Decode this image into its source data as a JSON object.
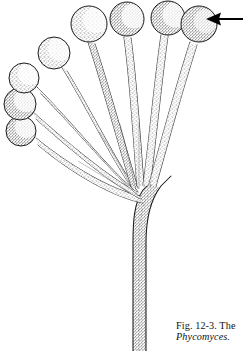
{
  "figure": {
    "kind": "scientific-line-illustration",
    "background_color": "#ffffff",
    "ink_color": "#1a1a1a",
    "stipple_color": "#555555",
    "caption": {
      "line1": "Fig. 12-3.  The",
      "line2": "Phycomyces.",
      "line2_style": "italic"
    },
    "pointer": {
      "name": "arrow-annotation",
      "direction": "left",
      "tip_x": 206,
      "tip_y": 19,
      "tail_x": 243,
      "tail_y": 19,
      "color": "#000000"
    },
    "main_stalk": {
      "name": "main-stipe",
      "description": "single thick stalk rising from bottom edge, bending left near top into branch fan",
      "base_x_left": 133,
      "base_x_right": 146,
      "base_y": 351,
      "bend_y": 215,
      "fan_x": 131,
      "fan_y": 188
    },
    "sporangiophores": [
      {
        "id": 1,
        "label": "sporangiophore-left-lowest",
        "head_cx": 21,
        "head_cy": 131,
        "head_r": 15,
        "stalk_from_x": 131,
        "stalk_from_y": 190,
        "ctrl_x": 80,
        "ctrl_y": 172,
        "shade_side": "left"
      },
      {
        "id": 2,
        "label": "sporangiophore-left-middle",
        "head_cx": 20,
        "head_cy": 104,
        "head_r": 16,
        "stalk_from_x": 132,
        "stalk_from_y": 190,
        "ctrl_x": 82,
        "ctrl_y": 158,
        "shade_side": "left"
      },
      {
        "id": 3,
        "label": "sporangiophore-left-upper",
        "head_cx": 24,
        "head_cy": 78,
        "head_r": 15,
        "stalk_from_x": 132,
        "stalk_from_y": 190,
        "ctrl_x": 86,
        "ctrl_y": 141,
        "shade_side": "left"
      },
      {
        "id": 4,
        "label": "sporangiophore-inner-left",
        "head_cx": 54,
        "head_cy": 53,
        "head_r": 16,
        "stalk_from_x": 133,
        "stalk_from_y": 190,
        "ctrl_x": 98,
        "ctrl_y": 133,
        "shade_side": "left"
      },
      {
        "id": 5,
        "label": "sporangiophore-center-tallest",
        "head_cx": 89,
        "head_cy": 24,
        "head_r": 18,
        "stalk_from_x": 134,
        "stalk_from_y": 190,
        "ctrl_x": 104,
        "ctrl_y": 120,
        "shade_side": "left"
      },
      {
        "id": 6,
        "label": "sporangiophore-center-right",
        "head_cx": 127,
        "head_cy": 19,
        "head_r": 17,
        "stalk_from_x": 136,
        "stalk_from_y": 190,
        "ctrl_x": 126,
        "ctrl_y": 118,
        "shade_side": "left"
      },
      {
        "id": 7,
        "label": "sporangiophore-right-inner",
        "head_cx": 168,
        "head_cy": 18,
        "head_r": 17,
        "stalk_from_x": 137,
        "stalk_from_y": 190,
        "ctrl_x": 143,
        "ctrl_y": 120,
        "shade_side": "left"
      },
      {
        "id": 8,
        "label": "sporangiophore-right-outer",
        "head_cx": 199,
        "head_cy": 24,
        "head_r": 18,
        "stalk_from_x": 138,
        "stalk_from_y": 190,
        "ctrl_x": 156,
        "ctrl_y": 126,
        "shade_side": "left"
      }
    ]
  }
}
